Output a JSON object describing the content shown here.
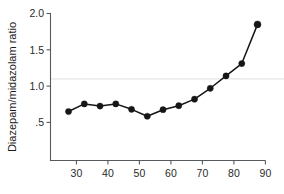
{
  "chart_data": {
    "type": "line",
    "title": "",
    "subtitle": "",
    "xlabel": "",
    "ylabel": "Diazepam/midazolam ratio",
    "x": [
      27.5,
      32.5,
      37.5,
      42.5,
      47.5,
      52.5,
      57.5,
      62.5,
      67.5,
      72.5,
      77.5,
      82.5,
      87.5
    ],
    "values": [
      0.65,
      0.755,
      0.725,
      0.755,
      0.68,
      0.585,
      0.675,
      0.73,
      0.82,
      0.97,
      1.14,
      1.31,
      1.85
    ],
    "series": [
      {
        "name": "Diazepam/midazolam ratio",
        "values": [
          0.65,
          0.755,
          0.725,
          0.755,
          0.68,
          0.585,
          0.675,
          0.73,
          0.82,
          0.97,
          1.14,
          1.31,
          1.85
        ]
      }
    ],
    "xlim": [
      24,
      91
    ],
    "ylim": [
      0.18,
      2.05
    ],
    "xticks": [
      30,
      40,
      50,
      60,
      70,
      80,
      90
    ],
    "xtick_labels": [
      "30",
      "40",
      "50",
      "60",
      "70",
      "80",
      "90"
    ],
    "yticks": [
      0.5,
      1.0,
      1.5,
      2.0
    ],
    "ytick_labels": [
      ".5",
      "1.0",
      "1.5",
      "2.0"
    ],
    "grid": false,
    "reference_line": {
      "orientation": "horizontal",
      "value": 1.1,
      "color": "#e9e6e2",
      "label": ""
    },
    "legend": {
      "visible": false,
      "position": "none",
      "entries": []
    },
    "marker": "filled-circle",
    "colors": {
      "line": "#161616",
      "marker": "#161616",
      "axis": "#555b5e",
      "background": "#ffffff"
    },
    "annotations": []
  }
}
